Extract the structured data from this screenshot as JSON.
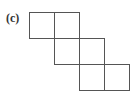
{
  "figure": {
    "label": "(c)",
    "square_size": 25,
    "stroke_color": "#555555",
    "squares": [
      {
        "row": 0,
        "col": 0
      },
      {
        "row": 0,
        "col": 1
      },
      {
        "row": 1,
        "col": 1
      },
      {
        "row": 1,
        "col": 2
      },
      {
        "row": 2,
        "col": 2
      },
      {
        "row": 2,
        "col": 3
      }
    ]
  }
}
